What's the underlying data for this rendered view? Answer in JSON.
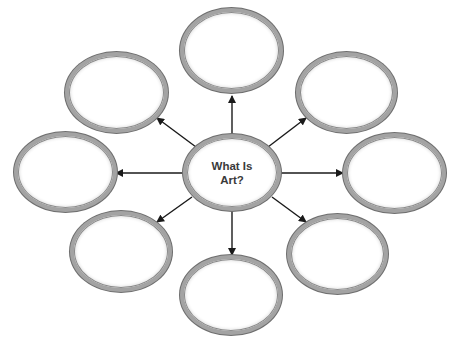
{
  "diagram": {
    "type": "idea-web",
    "center": {
      "label": "What Is\nArt?",
      "box": [
        183,
        134,
        281,
        211
      ]
    },
    "satellites": [
      {
        "position": "top",
        "label": "",
        "box": [
          180,
          8,
          283,
          93
        ]
      },
      {
        "position": "upper-left",
        "label": "",
        "box": [
          65,
          52,
          168,
          133
        ]
      },
      {
        "position": "upper-right",
        "label": "",
        "box": [
          296,
          52,
          397,
          133
        ]
      },
      {
        "position": "left",
        "label": "",
        "box": [
          14,
          132,
          117,
          212
        ]
      },
      {
        "position": "right",
        "label": "",
        "box": [
          343,
          133,
          446,
          213
        ]
      },
      {
        "position": "lower-left",
        "label": "",
        "box": [
          70,
          211,
          172,
          292
        ]
      },
      {
        "position": "bottom",
        "label": "",
        "box": [
          180,
          255,
          282,
          335
        ]
      },
      {
        "position": "lower-right",
        "label": "",
        "box": [
          287,
          214,
          388,
          294
        ]
      }
    ],
    "arrows": [
      {
        "to": "top",
        "from_xy": [
          232,
          134
        ],
        "to_xy": [
          232,
          96
        ]
      },
      {
        "to": "upper-left",
        "from_xy": [
          196,
          147
        ],
        "to_xy": [
          157,
          118
        ]
      },
      {
        "to": "upper-right",
        "from_xy": [
          268,
          147
        ],
        "to_xy": [
          306,
          118
        ]
      },
      {
        "to": "left",
        "from_xy": [
          183,
          173
        ],
        "to_xy": [
          116,
          173
        ]
      },
      {
        "to": "right",
        "from_xy": [
          281,
          173
        ],
        "to_xy": [
          343,
          173
        ]
      },
      {
        "to": "lower-left",
        "from_xy": [
          192,
          197
        ],
        "to_xy": [
          157,
          222
        ]
      },
      {
        "to": "bottom",
        "from_xy": [
          232,
          211
        ],
        "to_xy": [
          232,
          255
        ]
      },
      {
        "to": "lower-right",
        "from_xy": [
          272,
          197
        ],
        "to_xy": [
          306,
          222
        ]
      }
    ],
    "colors": {
      "ellipse_border": "#a3a3a3",
      "ellipse_outline": "#6e6e6e",
      "arrow": "#1a1a1a",
      "text": "#3a3a3a",
      "background": "#ffffff"
    }
  }
}
